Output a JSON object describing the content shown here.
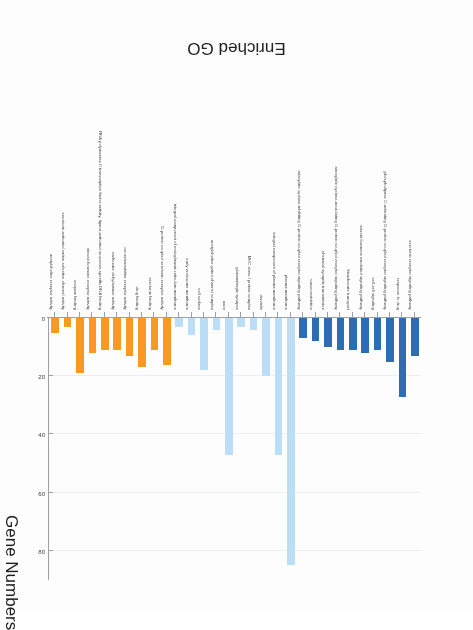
{
  "chart_data": {
    "type": "bar",
    "title": "",
    "xlabel": "Enriched GO",
    "ylabel": "Gene Numbers",
    "ylim": [
      0,
      90
    ],
    "yticks": [
      0,
      20,
      40,
      60,
      80
    ],
    "ytick_labels": [
      "0",
      "20",
      "40",
      "60",
      "80"
    ],
    "grid": true,
    "legend_position": "none",
    "orientation": "rotated-180",
    "categories": [
      "serotonin receptor signaling pathway",
      "response to drug",
      "phospholipase C-activating G-protein coupled receptor signaling pathway",
      "cell-cell signaling",
      "steroid hormone mediated signaling pathway",
      "bicarbonate transport",
      "adenylate cyclase-modulating G-protein coupled receptor signaling pathway",
      "chemical synaptic transmission",
      "vasoconstriction",
      "adenylate cyclase-inhibiting G-protein coupled receptor signaling pathway",
      "plasma membrane",
      "integral component of plasma membrane",
      "dendrite",
      "MHC class I protein complex",
      "glutamatergic synapse",
      "axon",
      "acetylcholine-gated channel complex",
      "cell surface",
      "early endosome membrane",
      "integral component of endoplasmic reticulum membrane",
      "G-protein coupled serotonin receptor activity",
      "serotonin binding",
      "drug binding",
      "neurotransmitter receptor activity",
      "carbonate dehydratase activity",
      "RNA polymerase II transcription factor activity, ligand-activated sequence-specific DNA binding",
      "steroid hormone receptor activity",
      "enzyme binding",
      "serotonin-activated cation-selective channel activity",
      "acetylcholine receptor activity"
    ],
    "values": [
      13,
      27,
      15,
      11,
      12,
      11,
      11,
      10,
      8,
      7,
      85,
      47,
      20,
      4,
      3,
      47,
      4,
      18,
      6,
      3,
      16,
      11,
      17,
      13,
      11,
      11,
      12,
      19,
      3,
      5
    ],
    "bar_colors": [
      "#2E6DB4",
      "#2E6DB4",
      "#2E6DB4",
      "#2E6DB4",
      "#2E6DB4",
      "#2E6DB4",
      "#2E6DB4",
      "#2E6DB4",
      "#2E6DB4",
      "#2E6DB4",
      "#BBDDF5",
      "#BBDDF5",
      "#BBDDF5",
      "#BBDDF5",
      "#BBDDF5",
      "#BBDDF5",
      "#BBDDF5",
      "#BBDDF5",
      "#BBDDF5",
      "#BBDDF5",
      "#F89A22",
      "#F89A22",
      "#F89A22",
      "#F89A22",
      "#F89A22",
      "#F89A22",
      "#F89A22",
      "#F89A22",
      "#F89A22",
      "#F89A22",
      "#F89A22"
    ],
    "groups": [
      {
        "name": "biological process",
        "color": "#2E6DB4",
        "count": 10
      },
      {
        "name": "cellular component",
        "color": "#BBDDF5",
        "count": 10
      },
      {
        "name": "molecular function",
        "color": "#F89A22",
        "count": 10
      }
    ],
    "colors": {
      "axis": "#9aa0a6",
      "grid": "#eceff1",
      "text": "#3c4043",
      "background": "#ffffff"
    }
  }
}
